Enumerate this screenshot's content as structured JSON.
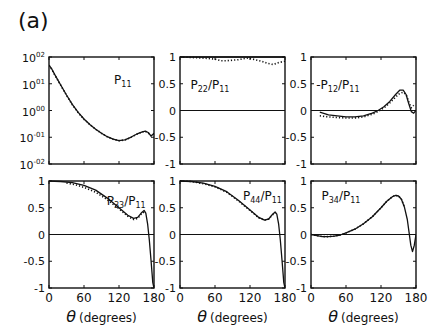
{
  "figure_label": "(a)",
  "chart_data": [
    {
      "id": "p11",
      "type": "line",
      "title": "P11",
      "title_main": "P",
      "title_sub": "11",
      "xlabel": "θ (degrees)",
      "ylabel": "",
      "yscale": "log",
      "xlim": [
        0,
        180
      ],
      "ylim": [
        0.01,
        100
      ],
      "xticks": [
        0,
        60,
        120,
        180
      ],
      "xtick_labels": [
        "",
        "",
        "",
        ""
      ],
      "yticks": [
        0.01,
        0.1,
        1,
        10,
        100
      ],
      "ytick_labels": [
        "10-02",
        "10-01",
        "1000",
        "1001",
        "1002"
      ],
      "ytick_labels_display": [
        {
          "base": "10",
          "exp": "-02"
        },
        {
          "base": "10",
          "exp": "-01"
        },
        {
          "base": "10",
          "exp": "00"
        },
        {
          "base": "10",
          "exp": "01"
        },
        {
          "base": "10",
          "exp": "02"
        }
      ],
      "zero_line": false,
      "series": [
        {
          "name": "solid",
          "style": "solid",
          "x": [
            0,
            5,
            10,
            20,
            30,
            40,
            50,
            60,
            70,
            80,
            90,
            100,
            110,
            120,
            130,
            140,
            150,
            160,
            165,
            170,
            175,
            180
          ],
          "y": [
            50,
            35,
            22,
            9,
            3.8,
            1.7,
            0.85,
            0.48,
            0.3,
            0.2,
            0.14,
            0.105,
            0.085,
            0.075,
            0.08,
            0.1,
            0.13,
            0.16,
            0.17,
            0.15,
            0.11,
            0.14
          ]
        },
        {
          "name": "dotted",
          "style": "dotted",
          "x": [
            0,
            5,
            10,
            20,
            30,
            40,
            50,
            60,
            70,
            80,
            90,
            100,
            110,
            120,
            130,
            140,
            150,
            160,
            165,
            170,
            175,
            180
          ],
          "y": [
            48,
            34,
            21,
            8.8,
            3.7,
            1.65,
            0.83,
            0.47,
            0.3,
            0.2,
            0.14,
            0.104,
            0.084,
            0.074,
            0.079,
            0.098,
            0.128,
            0.158,
            0.165,
            0.145,
            0.115,
            0.135
          ]
        }
      ]
    },
    {
      "id": "p22",
      "type": "line",
      "title": "P22/P11",
      "title_main": "P",
      "title_sub": "22",
      "title_div": "/P",
      "title_sub2": "11",
      "xlabel": "θ (degrees)",
      "yscale": "linear",
      "xlim": [
        0,
        180
      ],
      "ylim": [
        -1,
        1
      ],
      "xticks": [
        0,
        60,
        120,
        180
      ],
      "xtick_labels": [
        "",
        "",
        "",
        ""
      ],
      "yticks": [
        -1,
        -0.5,
        0,
        0.5,
        1
      ],
      "ytick_labels": [
        "-1",
        "-0.5",
        "0",
        "0.5",
        "1"
      ],
      "zero_line": true,
      "series": [
        {
          "name": "solid",
          "style": "solid",
          "x": [
            0,
            180
          ],
          "y": [
            1,
            1
          ]
        },
        {
          "name": "dotted",
          "style": "dotted",
          "x": [
            0,
            20,
            40,
            60,
            70,
            80,
            100,
            115,
            125,
            140,
            150,
            160,
            170,
            180
          ],
          "y": [
            1,
            0.99,
            0.98,
            0.96,
            0.93,
            0.93,
            0.95,
            0.98,
            0.96,
            0.92,
            0.88,
            0.86,
            0.9,
            0.92
          ]
        }
      ]
    },
    {
      "id": "p12",
      "type": "line",
      "title": "-P12/P11",
      "title_main": "-P",
      "title_sub": "12",
      "title_div": "/P",
      "title_sub2": "11",
      "xlabel": "θ (degrees)",
      "yscale": "linear",
      "xlim": [
        0,
        180
      ],
      "ylim": [
        -1,
        1
      ],
      "xticks": [
        0,
        60,
        120,
        180
      ],
      "xtick_labels": [
        "",
        "",
        "",
        ""
      ],
      "yticks": [
        -1,
        -0.5,
        0,
        0.5,
        1
      ],
      "ytick_labels": [
        "-1",
        "-0.5",
        "0",
        "0.5",
        "1"
      ],
      "zero_line": true,
      "series": [
        {
          "name": "solid",
          "style": "solid",
          "x": [
            15,
            30,
            45,
            60,
            75,
            90,
            105,
            115,
            125,
            135,
            145,
            152,
            158,
            163,
            167,
            172,
            176,
            180
          ],
          "y": [
            -0.03,
            -0.08,
            -0.1,
            -0.12,
            -0.12,
            -0.1,
            -0.05,
            0.0,
            0.07,
            0.17,
            0.3,
            0.38,
            0.38,
            0.3,
            0.15,
            -0.02,
            -0.05,
            0.0
          ]
        },
        {
          "name": "dotted",
          "style": "dotted",
          "x": [
            15,
            30,
            45,
            60,
            75,
            90,
            105,
            115,
            125,
            135,
            145,
            152,
            158,
            163,
            168,
            172,
            176
          ],
          "y": [
            -0.1,
            -0.12,
            -0.13,
            -0.14,
            -0.14,
            -0.12,
            -0.07,
            -0.02,
            0.05,
            0.14,
            0.25,
            0.32,
            0.34,
            0.3,
            0.15,
            0.05,
            0.1
          ]
        }
      ]
    },
    {
      "id": "p33",
      "type": "line",
      "title": "P33/P11",
      "title_main": "P",
      "title_sub": "33",
      "title_div": "/P",
      "title_sub2": "11",
      "xlabel": "θ (degrees)",
      "yscale": "linear",
      "xlim": [
        0,
        180
      ],
      "ylim": [
        -1,
        1
      ],
      "xticks": [
        0,
        60,
        120,
        180
      ],
      "xtick_labels": [
        "0",
        "60",
        "120",
        "180"
      ],
      "yticks": [
        -1,
        -0.5,
        0,
        0.5,
        1
      ],
      "ytick_labels": [
        "-1",
        "-0.5",
        "0",
        "0.5",
        "1"
      ],
      "zero_line": true,
      "series": [
        {
          "name": "solid",
          "style": "solid",
          "x": [
            0,
            20,
            40,
            60,
            80,
            100,
            120,
            135,
            145,
            152,
            158,
            163,
            166,
            169,
            172,
            175,
            178,
            180
          ],
          "y": [
            1,
            0.99,
            0.97,
            0.92,
            0.83,
            0.68,
            0.5,
            0.36,
            0.3,
            0.32,
            0.4,
            0.45,
            0.4,
            0.2,
            -0.1,
            -0.5,
            -0.9,
            -1
          ]
        },
        {
          "name": "dotted",
          "style": "dotted",
          "x": [
            30,
            45,
            60,
            80,
            100,
            120,
            135,
            145,
            152,
            158,
            163
          ],
          "y": [
            0.96,
            0.93,
            0.88,
            0.79,
            0.65,
            0.48,
            0.34,
            0.28,
            0.3,
            0.38,
            0.42
          ]
        }
      ]
    },
    {
      "id": "p44",
      "type": "line",
      "title": "P44/P11",
      "title_main": "P",
      "title_sub": "44",
      "title_div": "/P",
      "title_sub2": "11",
      "xlabel": "θ (degrees)",
      "yscale": "linear",
      "xlim": [
        0,
        180
      ],
      "ylim": [
        -1,
        1
      ],
      "xticks": [
        0,
        60,
        120,
        180
      ],
      "xtick_labels": [
        "0",
        "60",
        "120",
        "180"
      ],
      "yticks": [
        -1,
        -0.5,
        0,
        0.5,
        1
      ],
      "ytick_labels": [
        "-1",
        "-0.5",
        "0",
        "0.5",
        "1"
      ],
      "zero_line": true,
      "series": [
        {
          "name": "solid",
          "style": "solid",
          "x": [
            0,
            20,
            40,
            60,
            80,
            100,
            120,
            135,
            145,
            152,
            158,
            163,
            166,
            169,
            172,
            175,
            178,
            180
          ],
          "y": [
            1,
            0.99,
            0.96,
            0.9,
            0.8,
            0.64,
            0.46,
            0.32,
            0.27,
            0.29,
            0.37,
            0.42,
            0.38,
            0.2,
            -0.1,
            -0.5,
            -0.9,
            -1
          ]
        },
        {
          "name": "dotted",
          "style": "dotted",
          "x": [
            0,
            20,
            40,
            60,
            80,
            100,
            120,
            135,
            145,
            152,
            158,
            163
          ],
          "y": [
            1,
            0.99,
            0.95,
            0.89,
            0.79,
            0.63,
            0.45,
            0.31,
            0.27,
            0.29,
            0.36,
            0.41
          ]
        }
      ]
    },
    {
      "id": "p34",
      "type": "line",
      "title": "P34/P11",
      "title_main": "P",
      "title_sub": "34",
      "title_div": "/P",
      "title_sub2": "11",
      "xlabel": "θ (degrees)",
      "yscale": "linear",
      "xlim": [
        0,
        180
      ],
      "ylim": [
        -1,
        1
      ],
      "xticks": [
        0,
        60,
        120,
        180
      ],
      "xtick_labels": [
        "0",
        "60",
        "120",
        "180"
      ],
      "yticks": [
        -1,
        -0.5,
        0,
        0.5,
        1
      ],
      "ytick_labels": [
        "-1",
        "-0.5",
        "0",
        "0.5",
        "1"
      ],
      "zero_line": true,
      "series": [
        {
          "name": "solid",
          "style": "solid",
          "x": [
            0,
            10,
            20,
            30,
            40,
            50,
            60,
            75,
            90,
            105,
            120,
            130,
            140,
            145,
            150,
            155,
            160,
            165,
            168,
            171,
            174,
            177,
            180
          ],
          "y": [
            0,
            -0.02,
            -0.04,
            -0.04,
            -0.03,
            -0.01,
            0.03,
            0.1,
            0.2,
            0.33,
            0.5,
            0.62,
            0.71,
            0.73,
            0.72,
            0.66,
            0.52,
            0.28,
            0.05,
            -0.2,
            -0.32,
            -0.2,
            0.0
          ]
        },
        {
          "name": "dotted",
          "style": "dotted",
          "x": [
            0,
            10,
            20,
            30,
            40,
            50,
            60,
            75,
            90,
            105,
            120,
            130,
            140,
            145,
            150,
            155,
            160
          ],
          "y": [
            0,
            -0.02,
            -0.04,
            -0.04,
            -0.03,
            -0.01,
            0.03,
            0.1,
            0.2,
            0.33,
            0.5,
            0.62,
            0.71,
            0.73,
            0.72,
            0.66,
            0.52
          ]
        }
      ]
    }
  ]
}
